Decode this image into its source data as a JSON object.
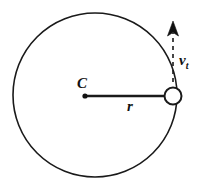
{
  "figure": {
    "kind": "physics-diagram",
    "background_color": "#ffffff",
    "stroke_color": "#1a1a1a",
    "width": 202,
    "height": 183
  },
  "labels": {
    "center": "C",
    "radius": "r",
    "velocity_symbol": "v",
    "velocity_subscript": "t"
  },
  "geometry": {
    "orbit_circle": {
      "center_x": 95,
      "center_y": 95,
      "radius": 82,
      "stroke_width": 1.6,
      "fill": "none"
    },
    "center_dot": {
      "x": 85,
      "y": 96,
      "radius": 2.6,
      "fill": "#111111"
    },
    "radius_line": {
      "x1": 85,
      "y1": 96,
      "x2": 165,
      "y2": 96,
      "stroke_width": 2.4
    },
    "particle": {
      "center_x": 173,
      "center_y": 96,
      "radius": 8.5,
      "stroke_width": 2,
      "fill": "#ffffff"
    },
    "velocity_arrow": {
      "x": 173,
      "tail_y": 82,
      "head_y": 22,
      "stroke_width": 1.6,
      "dash_pattern": "4,4",
      "head_width": 11,
      "head_length": 14
    }
  }
}
